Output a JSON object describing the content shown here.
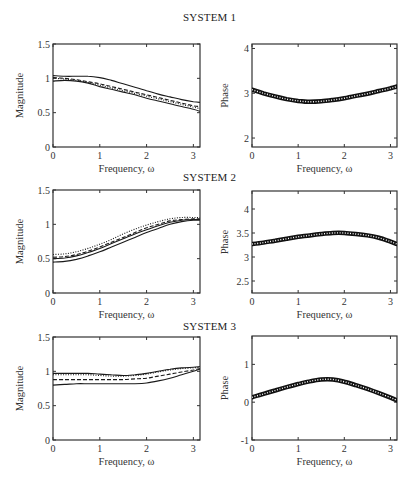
{
  "figure": {
    "titles": [
      "SYSTEM 1",
      "SYSTEM 2",
      "SYSTEM 3"
    ],
    "xlabel": "Frequency, ω"
  },
  "chart_data": [
    {
      "type": "line",
      "title": "SYSTEM 1",
      "panel": "magnitude",
      "xlabel": "Frequency, ω",
      "ylabel": "Magnitude",
      "xlim": [
        0,
        3.1416
      ],
      "ylim": [
        0,
        1.5
      ],
      "xticks": [
        0,
        1,
        2,
        3
      ],
      "yticks": [
        0,
        0.5,
        1,
        1.5
      ],
      "grid": false,
      "x": [
        0,
        0.25,
        0.5,
        0.75,
        1.0,
        1.25,
        1.5,
        1.75,
        2.0,
        2.25,
        2.5,
        2.75,
        3.0,
        3.14
      ],
      "series": [
        {
          "name": "upper bound",
          "style": "solid",
          "values": [
            1.04,
            1.03,
            1.03,
            1.03,
            1.01,
            0.97,
            0.92,
            0.87,
            0.82,
            0.77,
            0.73,
            0.69,
            0.66,
            0.65
          ]
        },
        {
          "name": "estimate",
          "style": "dashed",
          "values": [
            1.01,
            1.0,
            0.98,
            0.95,
            0.92,
            0.88,
            0.84,
            0.8,
            0.76,
            0.72,
            0.68,
            0.64,
            0.6,
            0.59
          ]
        },
        {
          "name": "true",
          "style": "dotted",
          "values": [
            1.0,
            0.99,
            0.97,
            0.94,
            0.9,
            0.86,
            0.82,
            0.78,
            0.74,
            0.7,
            0.66,
            0.62,
            0.58,
            0.56
          ]
        },
        {
          "name": "lower bound",
          "style": "solid",
          "values": [
            0.96,
            0.97,
            0.96,
            0.93,
            0.88,
            0.84,
            0.8,
            0.76,
            0.71,
            0.67,
            0.63,
            0.59,
            0.55,
            0.52
          ]
        }
      ]
    },
    {
      "type": "line",
      "title": "SYSTEM 1",
      "panel": "phase",
      "xlabel": "Frequency, ω",
      "ylabel": "Phase",
      "xlim": [
        0,
        3.1416
      ],
      "ylim": [
        1.8,
        4.1
      ],
      "xticks": [
        0,
        1,
        2,
        3
      ],
      "yticks": [
        2,
        3,
        4
      ],
      "grid": false,
      "x": [
        0,
        0.25,
        0.5,
        0.75,
        1.0,
        1.25,
        1.5,
        1.75,
        2.0,
        2.25,
        2.5,
        2.75,
        3.0,
        3.14
      ],
      "series": [
        {
          "name": "phase band",
          "style": "markers",
          "values": [
            3.08,
            3.0,
            2.93,
            2.87,
            2.83,
            2.81,
            2.82,
            2.85,
            2.89,
            2.94,
            2.99,
            3.05,
            3.11,
            3.15
          ]
        }
      ]
    },
    {
      "type": "line",
      "title": "SYSTEM 2",
      "panel": "magnitude",
      "xlabel": "Frequency, ω",
      "ylabel": "Magnitude",
      "xlim": [
        0,
        3.1416
      ],
      "ylim": [
        0,
        1.5
      ],
      "xticks": [
        0,
        1,
        2,
        3
      ],
      "yticks": [
        0,
        0.5,
        1,
        1.5
      ],
      "grid": false,
      "x": [
        0,
        0.25,
        0.5,
        0.75,
        1.0,
        1.25,
        1.5,
        1.75,
        2.0,
        2.25,
        2.5,
        2.75,
        3.0,
        3.14
      ],
      "series": [
        {
          "name": "upper bound",
          "style": "dotted",
          "values": [
            0.56,
            0.57,
            0.6,
            0.65,
            0.71,
            0.78,
            0.86,
            0.93,
            0.99,
            1.04,
            1.08,
            1.1,
            1.1,
            1.1
          ]
        },
        {
          "name": "estimate",
          "style": "dashed",
          "values": [
            0.52,
            0.53,
            0.56,
            0.61,
            0.67,
            0.74,
            0.81,
            0.88,
            0.95,
            1.0,
            1.05,
            1.07,
            1.08,
            1.08
          ]
        },
        {
          "name": "true",
          "style": "solid",
          "values": [
            0.5,
            0.51,
            0.54,
            0.59,
            0.65,
            0.72,
            0.79,
            0.86,
            0.92,
            0.98,
            1.03,
            1.06,
            1.07,
            1.07
          ]
        },
        {
          "name": "lower bound",
          "style": "solid",
          "values": [
            0.45,
            0.46,
            0.49,
            0.54,
            0.6,
            0.67,
            0.74,
            0.81,
            0.88,
            0.94,
            1.0,
            1.04,
            1.06,
            1.06
          ]
        }
      ]
    },
    {
      "type": "line",
      "title": "SYSTEM 2",
      "panel": "phase",
      "xlabel": "Frequency, ω",
      "ylabel": "Phase",
      "xlim": [
        0,
        3.1416
      ],
      "ylim": [
        2.25,
        4.375
      ],
      "xticks": [
        0,
        1,
        2,
        3
      ],
      "yticks": [
        2.5,
        3,
        3.5,
        4
      ],
      "grid": false,
      "x": [
        0,
        0.25,
        0.5,
        0.75,
        1.0,
        1.25,
        1.5,
        1.75,
        2.0,
        2.25,
        2.5,
        2.75,
        3.0,
        3.14
      ],
      "series": [
        {
          "name": "phase band",
          "style": "markers",
          "values": [
            3.27,
            3.3,
            3.34,
            3.38,
            3.42,
            3.45,
            3.48,
            3.5,
            3.5,
            3.48,
            3.45,
            3.4,
            3.32,
            3.27
          ]
        }
      ]
    },
    {
      "type": "line",
      "title": "SYSTEM 3",
      "panel": "magnitude",
      "xlabel": "Frequency, ω",
      "ylabel": "Magnitude",
      "xlim": [
        0,
        3.1416
      ],
      "ylim": [
        0,
        1.5
      ],
      "xticks": [
        0,
        1,
        2,
        3
      ],
      "yticks": [
        0,
        0.5,
        1,
        1.5
      ],
      "grid": false,
      "x": [
        0,
        0.25,
        0.5,
        0.75,
        1.0,
        1.25,
        1.5,
        1.75,
        2.0,
        2.25,
        2.5,
        2.75,
        3.0,
        3.14
      ],
      "series": [
        {
          "name": "upper bound",
          "style": "solid",
          "values": [
            0.97,
            0.97,
            0.97,
            0.97,
            0.96,
            0.95,
            0.94,
            0.95,
            0.97,
            1.0,
            1.03,
            1.05,
            1.06,
            1.07
          ]
        },
        {
          "name": "estimate",
          "style": "dotted",
          "values": [
            0.95,
            0.95,
            0.95,
            0.95,
            0.94,
            0.93,
            0.93,
            0.94,
            0.96,
            0.99,
            1.02,
            1.04,
            1.05,
            1.06
          ]
        },
        {
          "name": "true",
          "style": "dashed",
          "values": [
            0.88,
            0.88,
            0.88,
            0.88,
            0.88,
            0.88,
            0.88,
            0.89,
            0.9,
            0.93,
            0.96,
            0.99,
            1.02,
            1.04
          ]
        },
        {
          "name": "lower bound",
          "style": "solid",
          "values": [
            0.8,
            0.81,
            0.82,
            0.82,
            0.82,
            0.82,
            0.82,
            0.82,
            0.83,
            0.86,
            0.9,
            0.95,
            1.0,
            1.03
          ]
        }
      ]
    },
    {
      "type": "line",
      "title": "SYSTEM 3",
      "panel": "phase",
      "xlabel": "Frequency, ω",
      "ylabel": "Phase",
      "xlim": [
        0,
        3.1416
      ],
      "ylim": [
        -1,
        1.75
      ],
      "xticks": [
        0,
        1,
        2,
        3
      ],
      "yticks": [
        -1,
        0,
        1
      ],
      "grid": false,
      "x": [
        0,
        0.25,
        0.5,
        0.75,
        1.0,
        1.25,
        1.5,
        1.75,
        2.0,
        2.25,
        2.5,
        2.75,
        3.0,
        3.14
      ],
      "series": [
        {
          "name": "phase band",
          "style": "markers",
          "values": [
            0.13,
            0.22,
            0.31,
            0.4,
            0.48,
            0.55,
            0.6,
            0.6,
            0.54,
            0.45,
            0.35,
            0.24,
            0.12,
            0.05
          ]
        }
      ]
    }
  ]
}
